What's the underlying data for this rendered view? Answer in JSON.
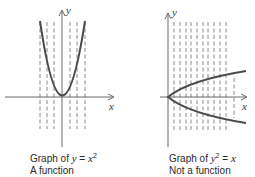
{
  "colors": {
    "background": "#ffffff",
    "axis": "#6a6a6a",
    "curve": "#4a4a4a",
    "dashes": "#8a8a8a",
    "text": "#2a2a2a"
  },
  "left_graph": {
    "x_axis_label": "x",
    "y_axis_label": "y",
    "equation": "y = x²",
    "caption_prefix": "Graph of ",
    "caption_lhs": "y",
    "caption_eq": " = ",
    "caption_rhs": "x",
    "caption_exp": "2",
    "verdict": "A function",
    "curve_type": "parabola opening upward, vertex at origin",
    "vertical_line_test": "each dashed vertical line crosses the curve at most once"
  },
  "right_graph": {
    "x_axis_label": "x",
    "y_axis_label": "y",
    "equation": "y² = x",
    "caption_prefix": "Graph of ",
    "caption_lhs": "y",
    "caption_exp": "2",
    "caption_eq": " = ",
    "caption_rhs": "x",
    "verdict": "Not a function",
    "curve_type": "parabola opening rightward, vertex at origin",
    "vertical_line_test": "dashed vertical lines cross the curve twice"
  }
}
